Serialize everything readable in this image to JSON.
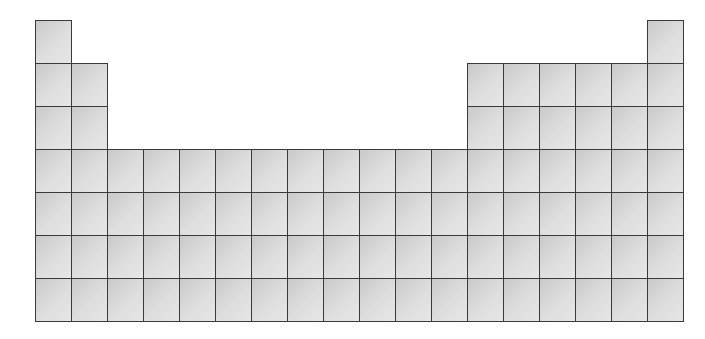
{
  "diagram": {
    "type": "periodic-table-outline",
    "columns": 18,
    "rows": 7,
    "origin": {
      "x": 35,
      "y": 20
    },
    "cell_width": 36,
    "cell_height": 43,
    "colors": {
      "border": "#3a3a3a",
      "fill_dark": "#c9c9c9",
      "fill_light": "#e6e6e6"
    },
    "row_layout": [
      {
        "period": 1,
        "columns": [
          1,
          18
        ]
      },
      {
        "period": 2,
        "columns": [
          1,
          2,
          13,
          14,
          15,
          16,
          17,
          18
        ]
      },
      {
        "period": 3,
        "columns": [
          1,
          2,
          13,
          14,
          15,
          16,
          17,
          18
        ]
      },
      {
        "period": 4,
        "columns": [
          1,
          2,
          3,
          4,
          5,
          6,
          7,
          8,
          9,
          10,
          11,
          12,
          13,
          14,
          15,
          16,
          17,
          18
        ]
      },
      {
        "period": 5,
        "columns": [
          1,
          2,
          3,
          4,
          5,
          6,
          7,
          8,
          9,
          10,
          11,
          12,
          13,
          14,
          15,
          16,
          17,
          18
        ]
      },
      {
        "period": 6,
        "columns": [
          1,
          2,
          3,
          4,
          5,
          6,
          7,
          8,
          9,
          10,
          11,
          12,
          13,
          14,
          15,
          16,
          17,
          18
        ]
      },
      {
        "period": 7,
        "columns": [
          1,
          2,
          3,
          4,
          5,
          6,
          7,
          8,
          9,
          10,
          11,
          12,
          13,
          14,
          15,
          16,
          17,
          18
        ]
      }
    ]
  }
}
